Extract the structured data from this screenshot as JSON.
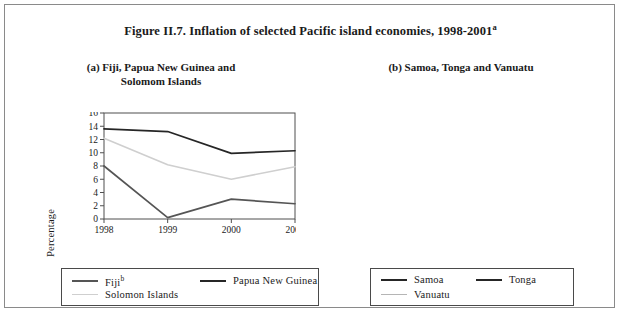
{
  "figure": {
    "title_main": "Figure II.7.  Inflation of selected Pacific island economies, 1998-2001",
    "title_superscript": "a"
  },
  "panel_a": {
    "heading_line1": "(a)  Fiji, Papua New Guinea and",
    "heading_line2": "Solomom Islands",
    "ylabel": "Percentage",
    "legend": [
      {
        "label": "Fiji",
        "superscript": "b",
        "color": "#555555"
      },
      {
        "label": "Papua New Guinea",
        "superscript": "",
        "color": "#262626"
      },
      {
        "label": "Solomon Islands",
        "superscript": "",
        "color": "#cfcfcf"
      }
    ]
  },
  "panel_b": {
    "heading_line1": "(b)  Samoa, Tonga and Vanuatu",
    "heading_line2": "",
    "ylabel": "Percentage",
    "legend": [
      {
        "label": "Samoa",
        "superscript": "",
        "color": "#262626"
      },
      {
        "label": "Tonga",
        "superscript": "",
        "color": "#262626"
      },
      {
        "label": "Vanuatu",
        "superscript": "",
        "color": "#b5b5b5"
      }
    ]
  },
  "chart_data": [
    {
      "type": "line",
      "title": "(a)  Fiji, Papua New Guinea and Solomom Islands",
      "xlabel": "",
      "ylabel": "Percentage",
      "categories": [
        "1998",
        "1999",
        "2000",
        "2001"
      ],
      "x": [
        1998,
        1999,
        2000,
        2001
      ],
      "ylim": [
        0,
        16
      ],
      "yticks": [
        0,
        2,
        4,
        6,
        8,
        10,
        12,
        14,
        16
      ],
      "grid": false,
      "legend_position": "below",
      "series": [
        {
          "name": "Fiji",
          "color": "#555555",
          "values": [
            8.0,
            0.2,
            3.0,
            2.3
          ]
        },
        {
          "name": "Papua New Guinea",
          "color": "#262626",
          "values": [
            13.6,
            13.2,
            9.9,
            10.3
          ]
        },
        {
          "name": "Solomon Islands",
          "color": "#cfcfcf",
          "values": [
            12.2,
            8.2,
            6.0,
            7.9
          ]
        }
      ]
    },
    {
      "type": "line",
      "title": "(b)  Samoa, Tonga and Vanuatu",
      "xlabel": "",
      "ylabel": "Percentage",
      "categories": [
        "1998",
        "1999",
        "2000",
        "2001"
      ],
      "x": [
        1998,
        1999,
        2000,
        2001
      ],
      "ylim": [
        0,
        9
      ],
      "yticks": [
        0,
        1,
        2,
        3,
        4,
        5,
        6,
        7,
        8,
        9
      ],
      "grid": false,
      "legend_position": "below",
      "series": [
        {
          "name": "Samoa",
          "color": "#262626",
          "values": [
            2.2,
            0.3,
            1.0,
            1.4
          ]
        },
        {
          "name": "Tonga",
          "color": "#262626",
          "values": [
            3.3,
            6.3,
            7.1,
            7.9
          ]
        },
        {
          "name": "Vanuatu",
          "color": "#b5b5b5",
          "values": [
            3.2,
            2.2,
            4.1,
            3.0
          ]
        }
      ]
    }
  ]
}
